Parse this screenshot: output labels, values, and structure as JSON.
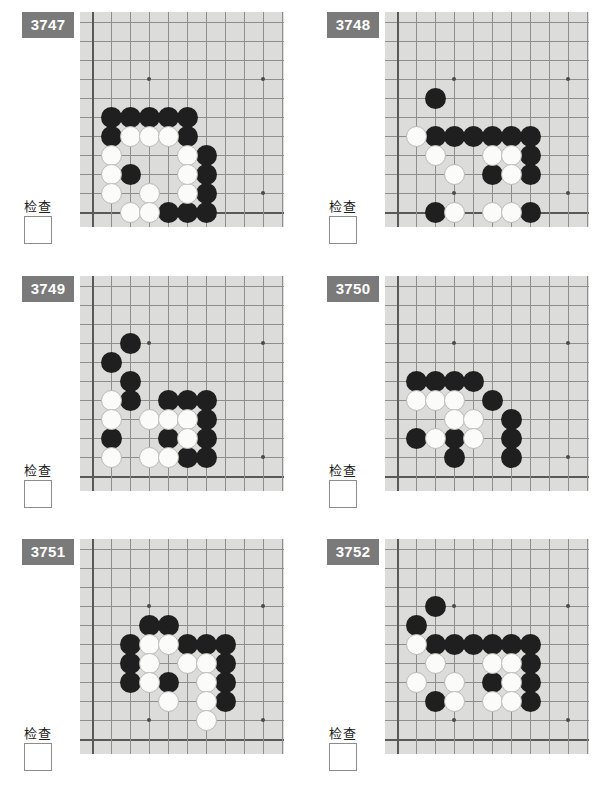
{
  "page": {
    "columns": 2,
    "rows": 3
  },
  "board_style": {
    "background_color": "#dcdcda",
    "line_color": "#8e8e8e",
    "edge_line_color": "#595959",
    "black_stone_color": "#201f1f",
    "white_stone_color": "#fbfbfa",
    "badge_color": "#7a7a7a",
    "badge_text_color": "#ffffff",
    "grid_cols": 10,
    "grid_rows": 10,
    "cell_size": 19,
    "hoshi_points": [
      [
        3,
        3
      ],
      [
        9,
        3
      ],
      [
        3,
        9
      ],
      [
        9,
        9
      ]
    ]
  },
  "labels": {
    "check_text": "检查"
  },
  "problems": [
    {
      "id": "3747",
      "number": "3747",
      "check_label": "检查",
      "checkbox_checked": false,
      "black_stones": [
        [
          1,
          5
        ],
        [
          2,
          5
        ],
        [
          3,
          5
        ],
        [
          4,
          5
        ],
        [
          5,
          5
        ],
        [
          1,
          6
        ],
        [
          5,
          6
        ],
        [
          6,
          7
        ],
        [
          2,
          8
        ],
        [
          6,
          8
        ],
        [
          6,
          9
        ],
        [
          4,
          10
        ],
        [
          5,
          10
        ],
        [
          6,
          10
        ]
      ],
      "white_stones": [
        [
          2,
          6
        ],
        [
          3,
          6
        ],
        [
          4,
          6
        ],
        [
          1,
          7
        ],
        [
          5,
          7
        ],
        [
          1,
          8
        ],
        [
          1,
          9
        ],
        [
          3,
          9
        ],
        [
          5,
          9
        ],
        [
          2,
          10
        ],
        [
          3,
          10
        ],
        [
          5,
          8
        ]
      ]
    },
    {
      "id": "3748",
      "number": "3748",
      "check_label": "检查",
      "checkbox_checked": false,
      "black_stones": [
        [
          2,
          4
        ],
        [
          2,
          6
        ],
        [
          3,
          6
        ],
        [
          4,
          6
        ],
        [
          5,
          6
        ],
        [
          6,
          6
        ],
        [
          7,
          6
        ],
        [
          7,
          7
        ],
        [
          5,
          8
        ],
        [
          7,
          8
        ],
        [
          2,
          10
        ],
        [
          7,
          10
        ]
      ],
      "white_stones": [
        [
          1,
          6
        ],
        [
          2,
          7
        ],
        [
          5,
          7
        ],
        [
          6,
          7
        ],
        [
          3,
          8
        ],
        [
          6,
          8
        ],
        [
          3,
          10
        ],
        [
          5,
          10
        ],
        [
          6,
          10
        ]
      ]
    },
    {
      "id": "3749",
      "number": "3749",
      "check_label": "检查",
      "checkbox_checked": false,
      "black_stones": [
        [
          2,
          3
        ],
        [
          1,
          4
        ],
        [
          2,
          5
        ],
        [
          2,
          6
        ],
        [
          4,
          6
        ],
        [
          5,
          6
        ],
        [
          6,
          6
        ],
        [
          6,
          7
        ],
        [
          1,
          8
        ],
        [
          4,
          8
        ],
        [
          6,
          8
        ],
        [
          5,
          9
        ],
        [
          6,
          9
        ]
      ],
      "white_stones": [
        [
          1,
          6
        ],
        [
          1,
          7
        ],
        [
          3,
          7
        ],
        [
          4,
          7
        ],
        [
          5,
          7
        ],
        [
          5,
          8
        ],
        [
          1,
          9
        ],
        [
          3,
          9
        ],
        [
          4,
          9
        ]
      ]
    },
    {
      "id": "3750",
      "number": "3750",
      "check_label": "检查",
      "checkbox_checked": false,
      "black_stones": [
        [
          1,
          5
        ],
        [
          2,
          5
        ],
        [
          3,
          5
        ],
        [
          4,
          5
        ],
        [
          5,
          6
        ],
        [
          6,
          7
        ],
        [
          1,
          8
        ],
        [
          3,
          8
        ],
        [
          6,
          8
        ],
        [
          3,
          9
        ],
        [
          6,
          9
        ]
      ],
      "white_stones": [
        [
          1,
          6
        ],
        [
          2,
          6
        ],
        [
          3,
          6
        ],
        [
          3,
          7
        ],
        [
          4,
          7
        ],
        [
          2,
          8
        ],
        [
          4,
          8
        ]
      ]
    },
    {
      "id": "3751",
      "number": "3751",
      "check_label": "检查",
      "checkbox_checked": false,
      "black_stones": [
        [
          3,
          4
        ],
        [
          4,
          4
        ],
        [
          2,
          5
        ],
        [
          5,
          5
        ],
        [
          6,
          5
        ],
        [
          7,
          5
        ],
        [
          2,
          6
        ],
        [
          7,
          6
        ],
        [
          2,
          7
        ],
        [
          4,
          7
        ],
        [
          7,
          7
        ],
        [
          7,
          8
        ]
      ],
      "white_stones": [
        [
          3,
          5
        ],
        [
          4,
          5
        ],
        [
          3,
          6
        ],
        [
          5,
          6
        ],
        [
          6,
          6
        ],
        [
          3,
          7
        ],
        [
          6,
          7
        ],
        [
          4,
          8
        ],
        [
          6,
          8
        ],
        [
          6,
          9
        ]
      ]
    },
    {
      "id": "3752",
      "number": "3752",
      "check_label": "检查",
      "checkbox_checked": false,
      "black_stones": [
        [
          2,
          3
        ],
        [
          1,
          4
        ],
        [
          2,
          5
        ],
        [
          3,
          5
        ],
        [
          4,
          5
        ],
        [
          5,
          5
        ],
        [
          6,
          5
        ],
        [
          7,
          5
        ],
        [
          7,
          6
        ],
        [
          5,
          7
        ],
        [
          7,
          7
        ],
        [
          2,
          8
        ],
        [
          7,
          8
        ]
      ],
      "white_stones": [
        [
          1,
          5
        ],
        [
          2,
          6
        ],
        [
          5,
          6
        ],
        [
          6,
          6
        ],
        [
          1,
          7
        ],
        [
          3,
          7
        ],
        [
          6,
          7
        ],
        [
          3,
          8
        ],
        [
          5,
          8
        ],
        [
          6,
          8
        ]
      ]
    }
  ]
}
